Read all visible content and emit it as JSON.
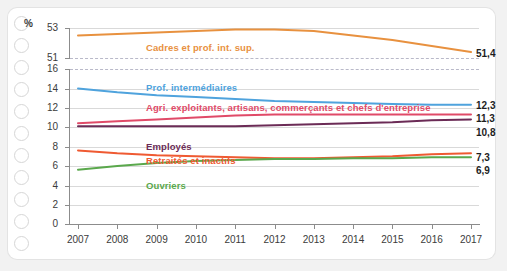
{
  "chart_data": {
    "type": "line",
    "title": "",
    "xlabel": "",
    "ylabel": "%",
    "ylim": [
      0,
      16
    ],
    "ylim_top": [
      51,
      53
    ],
    "axis_break": true,
    "grid": true,
    "legend_position": "inline-labels",
    "x": [
      2007,
      2008,
      2009,
      2010,
      2011,
      2012,
      2013,
      2014,
      2015,
      2016,
      2017
    ],
    "categories": [
      "2007",
      "2008",
      "2009",
      "2010",
      "2011",
      "2012",
      "2013",
      "2014",
      "2015",
      "2016",
      "2017"
    ],
    "yticks_top": [
      "53",
      "51"
    ],
    "yticks_bottom": [
      "16",
      "14",
      "12",
      "10",
      "8",
      "6",
      "4",
      "2",
      "0"
    ],
    "series": [
      {
        "name": "Cadres et prof. int. sup.",
        "color": "#e8913f",
        "axis": "top",
        "values": [
          52.5,
          52.6,
          52.7,
          52.8,
          52.9,
          52.9,
          52.8,
          52.5,
          52.2,
          51.8,
          51.4
        ],
        "end_value": "51,4"
      },
      {
        "name": "Prof. intermédiaires",
        "color": "#4fa3dd",
        "axis": "bottom",
        "values": [
          14.0,
          13.6,
          13.3,
          13.1,
          12.9,
          12.7,
          12.6,
          12.5,
          12.4,
          12.3,
          12.3
        ],
        "end_value": "12,3"
      },
      {
        "name": "Agri. exploitants, artisans, commerçants et chefs d'entreprise",
        "color": "#e04a68",
        "axis": "bottom",
        "values": [
          10.4,
          10.6,
          10.8,
          11.0,
          11.2,
          11.3,
          11.3,
          11.3,
          11.3,
          11.3,
          11.3
        ],
        "end_value": "11,3"
      },
      {
        "name": "Employés",
        "color": "#6b2b56",
        "axis": "bottom",
        "values": [
          10.1,
          10.1,
          10.1,
          10.1,
          10.1,
          10.2,
          10.3,
          10.4,
          10.5,
          10.7,
          10.8
        ],
        "end_value": "10,8"
      },
      {
        "name": "Retraités et inactifs",
        "color": "#ef5a32",
        "axis": "bottom",
        "values": [
          7.6,
          7.3,
          7.1,
          7.0,
          6.9,
          6.8,
          6.8,
          6.9,
          7.0,
          7.2,
          7.3
        ],
        "end_value": "7,3"
      },
      {
        "name": "Ouvriers",
        "color": "#5aa84c",
        "axis": "bottom",
        "values": [
          5.6,
          6.0,
          6.3,
          6.5,
          6.6,
          6.7,
          6.7,
          6.8,
          6.8,
          6.9,
          6.9
        ],
        "end_value": "6,9"
      }
    ]
  },
  "labels": {
    "percent_symbol": "%",
    "s0": "Cadres et prof. int. sup.",
    "s1": "Prof. intermédiaires",
    "s2": "Agri. exploitants, artisans, commerçants et chefs d'entreprise",
    "s3": "Employés",
    "s4": "Retraités et inactifs",
    "s5": "Ouvriers",
    "e0": "51,4",
    "e1": "12,3",
    "e2": "11,3",
    "e3": "10,8",
    "e4": "7,3",
    "e5": "6,9",
    "y_top_0": "53",
    "y_top_1": "51",
    "y_0": "16",
    "y_1": "14",
    "y_2": "12",
    "y_3": "10",
    "y_4": "8",
    "y_5": "6",
    "y_6": "4",
    "y_7": "2",
    "y_8": "0",
    "x_0": "2007",
    "x_1": "2008",
    "x_2": "2009",
    "x_3": "2010",
    "x_4": "2011",
    "x_5": "2012",
    "x_6": "2013",
    "x_7": "2014",
    "x_8": "2015",
    "x_9": "2016",
    "x_10": "2017"
  }
}
